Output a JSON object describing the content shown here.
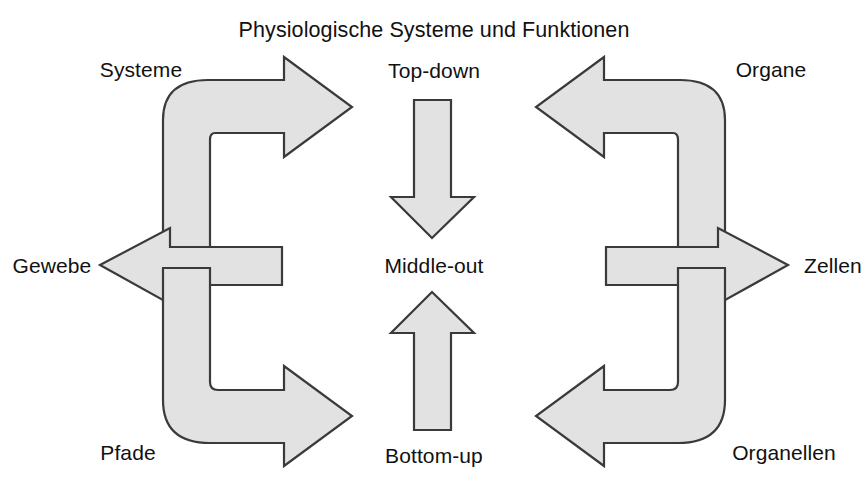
{
  "diagram": {
    "title": "Physiologische Systeme und Funktionen",
    "style": {
      "shape_fill": "#e2e2e2",
      "shape_stroke": "#3a3a3a",
      "background": "#ffffff",
      "text_color": "#111111"
    },
    "center_column": {
      "top_label": "Top-down",
      "middle_label": "Middle-out",
      "bottom_label": "Bottom-up",
      "down_arrow_name": "arrow-down",
      "up_arrow_name": "arrow-up"
    },
    "left_branch": {
      "name": "top-down-branch",
      "labels": {
        "upper": "Systeme",
        "middle": "Gewebe",
        "lower": "Pfade"
      }
    },
    "right_branch": {
      "name": "bottom-up-branch",
      "labels": {
        "upper": "Organe",
        "middle": "Zellen",
        "lower": "Organellen"
      }
    },
    "levels": [
      "Systeme",
      "Organe",
      "Gewebe",
      "Zellen",
      "Pfade",
      "Organellen"
    ],
    "approaches": [
      "Top-down",
      "Middle-out",
      "Bottom-up"
    ]
  }
}
